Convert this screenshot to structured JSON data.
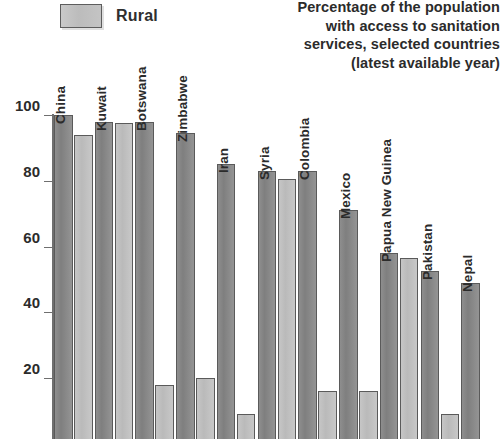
{
  "legend": {
    "items": [
      {
        "label": "Rural",
        "swatch_color": "#c2c2c2"
      }
    ]
  },
  "title": {
    "lines": [
      "Percentage of the population",
      "with access to sanitation",
      "services, selected countries",
      "(latest available year)"
    ]
  },
  "axis": {
    "y_ticks": [
      "100",
      "80",
      "60",
      "40",
      "20"
    ]
  },
  "chart_data": {
    "type": "bar",
    "title": "Percentage of the population with access to sanitation services, selected countries (latest available year)",
    "xlabel": "",
    "ylabel": "",
    "ylim": [
      0,
      100
    ],
    "yticks": [
      20,
      40,
      60,
      80,
      100
    ],
    "grid": false,
    "legend_position": "top-left",
    "categories": [
      "China",
      "Kuwait",
      "Botswana",
      "Zimbabwe",
      "Iran",
      "Syria",
      "Colombia",
      "Mexico",
      "Papua New Guinea",
      "Pakistan",
      "Nepal"
    ],
    "series": [
      {
        "name": "Urban",
        "color": "#8a8a8a",
        "values": [
          100,
          98,
          98,
          94.5,
          85,
          83,
          83,
          71,
          58,
          52.5,
          49
        ]
      },
      {
        "name": "Rural",
        "color": "#c2c2c2",
        "values": [
          94,
          97.5,
          18,
          20,
          9,
          80.5,
          16,
          16,
          56.5,
          9,
          null
        ]
      }
    ]
  }
}
